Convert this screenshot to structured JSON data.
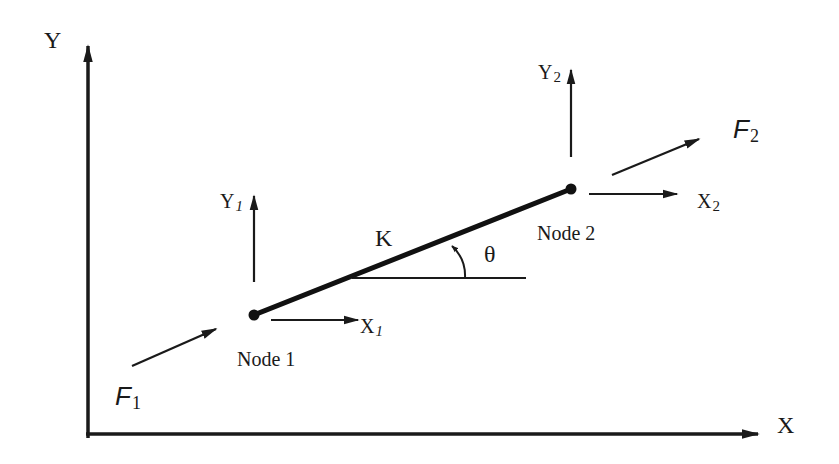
{
  "diagram": {
    "type": "spring element two-node free body diagram",
    "global_axes": {
      "x_label": "X",
      "y_label": "Y"
    },
    "element": {
      "stiffness_label": "K",
      "angle_label": "θ"
    },
    "node1": {
      "label": "Node 1",
      "x_dof": {
        "base": "X",
        "sub": "1"
      },
      "y_dof": {
        "base": "Y",
        "sub": "1"
      },
      "force": {
        "base": "F",
        "sub": "1"
      }
    },
    "node2": {
      "label": "Node 2",
      "x_dof": {
        "base": "X",
        "sub": "2"
      },
      "y_dof": {
        "base": "Y",
        "sub": "2"
      },
      "force": {
        "base": "F",
        "sub": "2"
      }
    },
    "colors": {
      "ink": "#1a1a1a",
      "background": "#ffffff"
    }
  }
}
